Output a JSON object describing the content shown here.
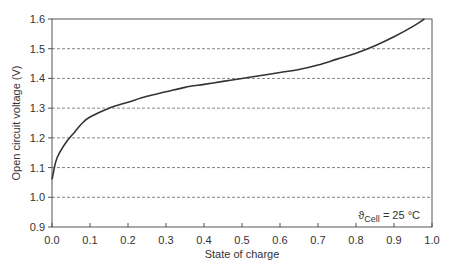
{
  "chart_data": {
    "type": "line",
    "title": "",
    "xlabel": "State of charge",
    "ylabel": "Open circuit voltage (V)",
    "xlim": [
      0.0,
      1.0
    ],
    "ylim": [
      0.9,
      1.6
    ],
    "x_ticks": [
      "0.0",
      "0.1",
      "0.2",
      "0.3",
      "0.4",
      "0.5",
      "0.6",
      "0.7",
      "0.8",
      "0.9",
      "1.0"
    ],
    "y_ticks": [
      "0.9",
      "1.0",
      "1.1",
      "1.2",
      "1.3",
      "1.4",
      "1.5",
      "1.6"
    ],
    "grid": "horizontal dashed",
    "annotation": {
      "symbol": "ϑ",
      "subscript": "Cell",
      "text": " = 25 °C"
    },
    "series": [
      {
        "name": "OCV",
        "x": [
          0.0,
          0.01,
          0.02,
          0.04,
          0.06,
          0.08,
          0.1,
          0.15,
          0.2,
          0.25,
          0.3,
          0.35,
          0.4,
          0.45,
          0.5,
          0.55,
          0.6,
          0.65,
          0.7,
          0.75,
          0.8,
          0.85,
          0.9,
          0.95,
          0.98
        ],
        "y": [
          1.06,
          1.12,
          1.15,
          1.19,
          1.22,
          1.25,
          1.27,
          1.3,
          1.32,
          1.34,
          1.355,
          1.37,
          1.38,
          1.39,
          1.4,
          1.41,
          1.42,
          1.43,
          1.445,
          1.465,
          1.485,
          1.51,
          1.54,
          1.575,
          1.6
        ]
      }
    ]
  }
}
